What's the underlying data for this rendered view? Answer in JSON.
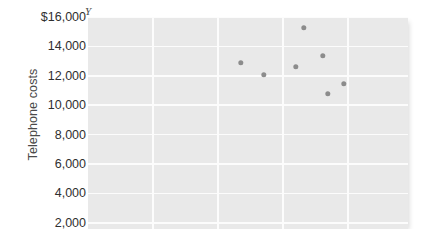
{
  "chart_data": {
    "type": "scatter",
    "title": "",
    "xlabel": "",
    "ylabel": "Telephone costs",
    "axis_marker": "Y",
    "ylim": [
      2000,
      16000
    ],
    "ytick_labels": [
      "$16,000",
      "14,000",
      "12,000",
      "10,000",
      "8,000",
      "6,000",
      "4,000",
      "2,000"
    ],
    "ytick_values": [
      16000,
      14000,
      12000,
      10000,
      8000,
      6000,
      4000,
      2000
    ],
    "grid": true,
    "legend": "none",
    "plot_background": "#e9e9e9",
    "gridline_color": "#fcfcfc",
    "point_color": "#8c8c8c",
    "vertical_gridline_count": 5,
    "points": [
      {
        "x_px": 241,
        "y": 12900
      },
      {
        "x_px": 264,
        "y": 12050
      },
      {
        "x_px": 296,
        "y": 12600
      },
      {
        "x_px": 304,
        "y": 15250
      },
      {
        "x_px": 323,
        "y": 13350
      },
      {
        "x_px": 328,
        "y": 10760
      },
      {
        "x_px": 344,
        "y": 11440
      }
    ]
  }
}
